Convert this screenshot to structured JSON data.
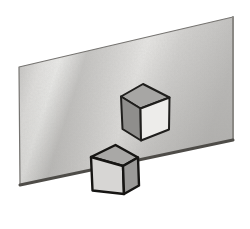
{
  "figure": {
    "background_color": "#ffffff",
    "plane": {
      "points": "19,67 233,17 233,140 20,185",
      "outline_color": "#757370",
      "outline_width": "1.2",
      "gradient_stops": [
        "#d8d7d5",
        "#cfcecc",
        "#e7e6e4",
        "#f0f0ee",
        "#c9c8c6",
        "#d5d4d2",
        "#eae9e7",
        "#d3d2d0",
        "#c7c6c4",
        "#bfbebc"
      ],
      "shade_top": "rgba(86,84,80,0)",
      "shade_bottom": "rgba(86,84,80,0.16)",
      "right_edge_points": "233,17 233,140",
      "right_edge_color": "#8a8884",
      "right_edge_width": "2",
      "bottom_edge_points": "20,185 233,140",
      "bottom_edge_color": "#4e4c48",
      "bottom_edge_width": "3"
    },
    "cubes": {
      "upper": {
        "stroke": "#1f1e1c",
        "stroke_width": "2",
        "faces": {
          "top": {
            "points": "121,96.5 143,84 169.5,97.5 140.5,108.5",
            "fill": "#a7a6a4"
          },
          "left": {
            "points": "121,96.5 140.5,108.5 141,140.5 122.5,129",
            "fill": "#8f8e8c"
          },
          "front": {
            "points": "140.5,108.5 169.5,97.5 169,129.5 141,140.5",
            "fill": "#edecea"
          }
        }
      },
      "lower": {
        "stroke": "#161513",
        "stroke_width": "2.4",
        "faces": {
          "top": {
            "points": "91,157 115.5,145 138,157.5 123,166",
            "fill": "#a9a8a6"
          },
          "front": {
            "points": "91,157 123,166 124,194 92.5,190.5",
            "fill": "#d7d6d4"
          },
          "right": {
            "points": "123,166 138,157.5 139,185.5 124,194",
            "fill": "#9b9a98"
          }
        }
      }
    }
  }
}
